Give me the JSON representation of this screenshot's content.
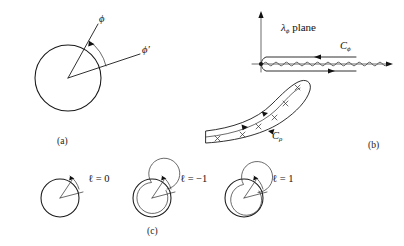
{
  "figure": {
    "panels": [
      {
        "id": "a",
        "tag": "(a)",
        "description": "circle with two radial rays and angular arc",
        "labels": {
          "phi": "ϕ",
          "phi_prime": "ϕ′"
        }
      },
      {
        "id": "b",
        "tag": "(b)",
        "description": "complex lambda-phi plane with branch cut and integration contours",
        "labels": {
          "plane_symbol": "λ",
          "plane_subscript": "ϕ",
          "plane_word": "plane",
          "contour_phi": "C",
          "contour_phi_sub": "ϕ",
          "contour_rho": "C",
          "contour_rho_sub": "ρ",
          "pole_marker": "×"
        }
      },
      {
        "id": "c",
        "tag": "(c)",
        "description": "three winding-number diagrams",
        "items": [
          {
            "label": "ℓ = 0",
            "winding": 0
          },
          {
            "label": "ℓ = −1",
            "winding": -1
          },
          {
            "label": "ℓ = 1",
            "winding": 1
          }
        ]
      }
    ],
    "colors": {
      "ink": "#1a1a1a",
      "background": "#ffffff"
    }
  }
}
